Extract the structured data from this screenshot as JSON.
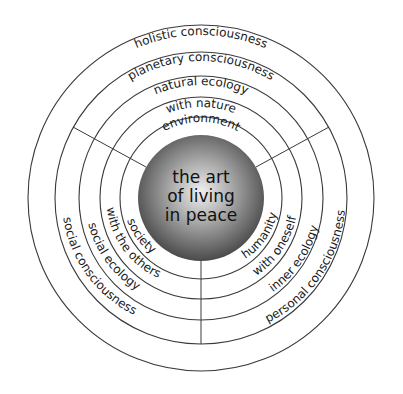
{
  "diagram": {
    "center_label": [
      "the art",
      "of living",
      "in peace"
    ],
    "rings": {
      "top": [
        "environment",
        "with nature",
        "natural ecology",
        "planetary consciousness",
        "holistic consciousness"
      ],
      "left": [
        "society",
        "with the others",
        "social ecology",
        "social consciousness"
      ],
      "right": [
        "humanity",
        "with oneself",
        "inner ecology",
        "personal consciousness"
      ]
    },
    "colors": {
      "line": "#3a3a3a",
      "sphere_light": "#eeeeee",
      "sphere_dark": "#555555",
      "text": "#1a1a1a"
    }
  }
}
